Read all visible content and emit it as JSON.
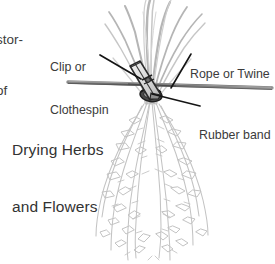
{
  "figure": {
    "title_line1": "Drying Herbs",
    "title_line2": "and Flowers",
    "body_text_line1": "stor-",
    "body_text_line2": "of",
    "background_color": "#ffffff",
    "ink_color": "#3b3b3b"
  },
  "callouts": {
    "clip": {
      "line1": "Clip or",
      "line2": "Clothespin",
      "leader_from": "label",
      "leader_to": "clothespin"
    },
    "rope": {
      "line1": "Rope or Twine",
      "leader_from": "label",
      "leader_to": "rope"
    },
    "rubber_band": {
      "line1": "Rubber band",
      "leader_from": "label",
      "leader_to": "bundle-knot"
    }
  },
  "illustration": {
    "description": "Bunch of herbs hung upside down from a horizontal rope, secured with a rubber band and a wooden clothespin clip",
    "elements": [
      "rope",
      "clothespin",
      "rubber-band",
      "herb-stems",
      "herb-foliage"
    ],
    "colors": {
      "rope": "#6f6f6f",
      "clothespin_outline": "#2e2e2e",
      "clothespin_fill": "#d9d9d9",
      "rubber_band": "#3a3a3a",
      "stems": "#b9b9b9",
      "foliage": "#c2c2c2",
      "leader_line": "#1c1c1c"
    }
  }
}
